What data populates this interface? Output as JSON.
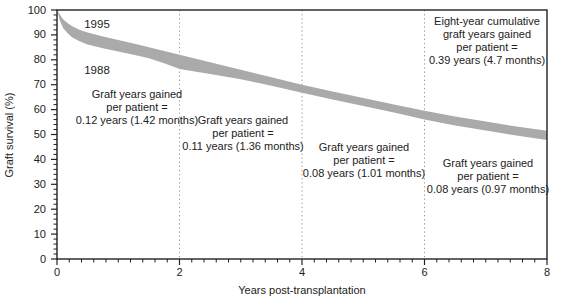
{
  "figure": {
    "band_color_note": "gray band spans area between 1995 (upper) and 1988 (lower) survival curves",
    "text_color": "#222222",
    "background_color": "#ffffff"
  },
  "chart_data": {
    "type": "area",
    "title": "",
    "xlabel": "Years post-transplantation",
    "ylabel": "Graft survival (%)",
    "xlim": [
      0,
      8
    ],
    "ylim": [
      0,
      100
    ],
    "x_major_ticks": [
      0,
      2,
      4,
      6,
      8
    ],
    "x_minor_tick_step": 0.2,
    "y_major_ticks": [
      0,
      10,
      20,
      30,
      40,
      50,
      60,
      70,
      80,
      90,
      100
    ],
    "y_minor_tick_step": 2,
    "gridlines": {
      "style": "dotted-vertical",
      "x": [
        2,
        4,
        6
      ]
    },
    "band_color": "#aaaaaa",
    "legend_position": "curve labels inside plot, upper-left",
    "x": [
      0,
      0.05,
      0.1,
      0.175,
      0.25,
      0.375,
      0.5,
      0.75,
      1,
      1.25,
      1.5,
      1.75,
      2,
      2.5,
      3,
      3.5,
      4,
      4.5,
      5,
      5.5,
      6,
      6.5,
      7,
      7.5,
      8
    ],
    "series": [
      {
        "name": "1995",
        "values": [
          100,
          98,
          96.3,
          94.7,
          93.5,
          92,
          91,
          89.4,
          88,
          86.5,
          85,
          83.5,
          82,
          79,
          76,
          73,
          70,
          67.3,
          64.7,
          62,
          59.5,
          57.2,
          55.2,
          53.2,
          51.5
        ]
      },
      {
        "name": "1988",
        "values": [
          100,
          95.5,
          92.8,
          90.7,
          89,
          87.3,
          86.2,
          84.6,
          83.3,
          82,
          80.6,
          78.6,
          76.3,
          74.3,
          72.2,
          69.6,
          66.8,
          64.1,
          61.5,
          58.8,
          56,
          53.6,
          51.6,
          49.6,
          47.8
        ]
      }
    ],
    "annotations": [
      {
        "id": "segment-0-2",
        "x_range": [
          0,
          2
        ],
        "lines": [
          "Graft years gained",
          "per patient =",
          "0.12 years (1.42 months)"
        ]
      },
      {
        "id": "segment-2-4",
        "x_range": [
          2,
          4
        ],
        "lines": [
          "Graft years gained",
          "per patient =",
          "0.11 years (1.36 months)"
        ]
      },
      {
        "id": "segment-4-6",
        "x_range": [
          4,
          6
        ],
        "lines": [
          "Graft years gained",
          "per patient =",
          "0.08 years (1.01 months)"
        ]
      },
      {
        "id": "segment-6-8",
        "x_range": [
          6,
          8
        ],
        "lines": [
          "Graft years gained",
          "per patient =",
          "0.08 years (0.97 months)"
        ]
      },
      {
        "id": "eight-year-cumulative",
        "lines": [
          "Eight-year cumulative",
          "graft years gained",
          "per patient =",
          "0.39 years (4.7 months)"
        ]
      }
    ]
  }
}
